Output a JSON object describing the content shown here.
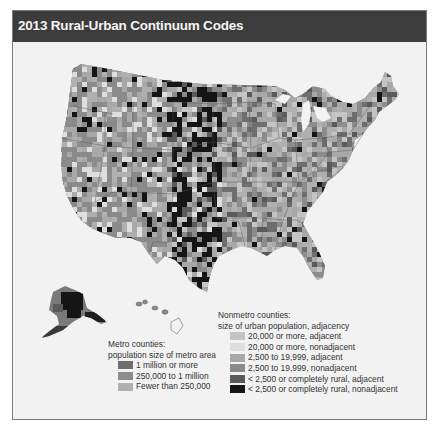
{
  "title": "2013 Rural-Urban Continuum Codes",
  "map": {
    "regions": [
      "Contiguous United States",
      "Alaska",
      "Hawaii"
    ],
    "colors": {
      "background": "#f2f2f2",
      "title_bar": "#3c3c3c",
      "state_border": "#5a5a5a"
    }
  },
  "legend": {
    "metro": {
      "heading_line1": "Metro counties:",
      "heading_line2": "population size of metro area",
      "items": [
        {
          "label": "1 million or more",
          "color": "#6e6e6e"
        },
        {
          "label": "250,000 to 1 million",
          "color": "#8c8c8c"
        },
        {
          "label": "Fewer than 250,000",
          "color": "#b0b0b0"
        }
      ]
    },
    "nonmetro": {
      "heading_line1": "Nonmetro counties:",
      "heading_line2": "size of urban population, adjacency",
      "items": [
        {
          "label": "20,000 or more, adjacent",
          "color": "#c4c4c4"
        },
        {
          "label": "20,000 or more, nonadjacent",
          "color": "#dedede"
        },
        {
          "label": "2,500 to 19,999, adjacent",
          "color": "#a8a8a8"
        },
        {
          "label": "2,500 to 19,999, nonadjacent",
          "color": "#8a8a8a"
        },
        {
          "label": "< 2,500 or completely rural, adjacent",
          "color": "#5a5a5a"
        },
        {
          "label": "< 2,500 or completely rural, nonadjacent",
          "color": "#151515"
        }
      ]
    }
  }
}
